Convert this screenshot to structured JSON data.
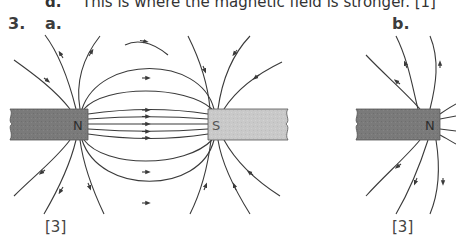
{
  "previous_item": {
    "letter": "d.",
    "text": "This is where the magnetic field is stronger. [1]"
  },
  "question": {
    "number": "3.",
    "parts": [
      {
        "label": "a.",
        "marks": "[3]",
        "diagram": {
          "description": "Magnetic field lines between a north pole and a south pole of two bar magnets facing each other; arrows point from N to S",
          "magnets": [
            {
              "pole": "N",
              "color": "#7a7a7a"
            },
            {
              "pole": "S",
              "color": "#c9c9c9"
            }
          ]
        }
      },
      {
        "label": "b.",
        "marks": "[3]",
        "diagram": {
          "description": "Magnetic field lines around the north pole of a single bar magnet; arrows point away from N",
          "magnets": [
            {
              "pole": "N",
              "color": "#7a7a7a"
            }
          ]
        }
      }
    ]
  },
  "colors": {
    "field_line": "#3a3a3a",
    "north_bar": "#7a7a7a",
    "south_bar": "#c9c9c9",
    "text": "#3a3a3a"
  }
}
